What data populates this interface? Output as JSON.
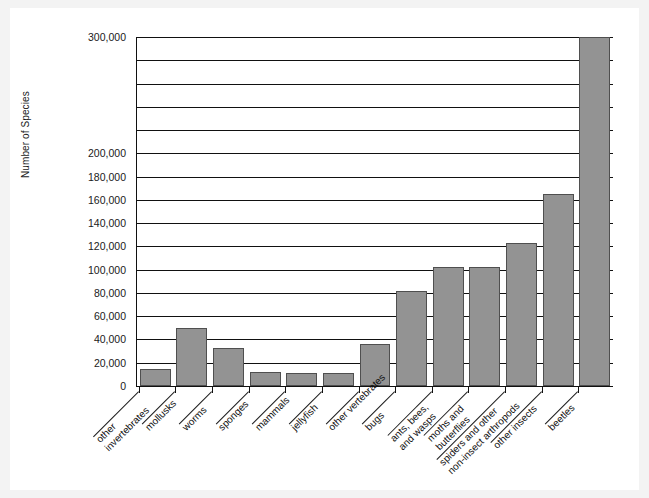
{
  "chart_data": {
    "type": "bar",
    "title": "",
    "xlabel": "",
    "ylabel": "Number of Species",
    "ylim": [
      0,
      300000
    ],
    "grid": true,
    "legend": null,
    "orientation": "vertical",
    "bar_color": "#939393",
    "bar_edge_color": "#4f4f4f",
    "axis_color": "#111111",
    "background": "#ffffff",
    "y_ticks": [
      {
        "value": 0,
        "label": "0"
      },
      {
        "value": 20000,
        "label": "20,000"
      },
      {
        "value": 40000,
        "label": "40,000"
      },
      {
        "value": 60000,
        "label": "60,000"
      },
      {
        "value": 80000,
        "label": "80,000"
      },
      {
        "value": 100000,
        "label": "100,000"
      },
      {
        "value": 120000,
        "label": "120,000"
      },
      {
        "value": 140000,
        "label": "140,000"
      },
      {
        "value": 160000,
        "label": "160,000"
      },
      {
        "value": 180000,
        "label": "180,000"
      },
      {
        "value": 200000,
        "label": "200,000"
      },
      {
        "value": 220000,
        "label": ""
      },
      {
        "value": 240000,
        "label": ""
      },
      {
        "value": 260000,
        "label": ""
      },
      {
        "value": 280000,
        "label": ""
      },
      {
        "value": 300000,
        "label": "300,000"
      }
    ],
    "categories": [
      "other\ninvertebrates",
      "mollusks",
      "worms",
      "sponges",
      "mammals",
      "jellyfish",
      "other vertebrates",
      "bugs",
      "ants, bees,\nand wasps",
      "moths and\nbutterflies",
      "spiders and other\nnon-insect arthropods",
      "other insects",
      "beetles"
    ],
    "values": [
      15000,
      50000,
      33000,
      12000,
      11000,
      11000,
      36000,
      82000,
      102000,
      102000,
      123000,
      165000,
      300000
    ]
  }
}
